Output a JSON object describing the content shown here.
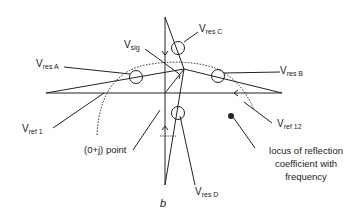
{
  "diagram": {
    "labels": {
      "v_sig": {
        "main": "V",
        "sub": "sig"
      },
      "v_res_a": {
        "main": "V",
        "sub": "res A"
      },
      "v_res_b": {
        "main": "V",
        "sub": "res B"
      },
      "v_res_c": {
        "main": "V",
        "sub": "res C"
      },
      "v_res_d": {
        "main": "V",
        "sub": "res D"
      },
      "v_ref_1": {
        "main": "V",
        "sub": "ref 1"
      },
      "v_ref_12": {
        "main": "V",
        "sub": "ref 12"
      },
      "zero_j_point": "(0+j) point",
      "locus_line1": "locus of reflection",
      "locus_line2": "coefficient with",
      "locus_line3": "frequency",
      "figure_label": "b"
    },
    "colors": {
      "stroke": "#222222",
      "background": "#ffffff"
    }
  }
}
